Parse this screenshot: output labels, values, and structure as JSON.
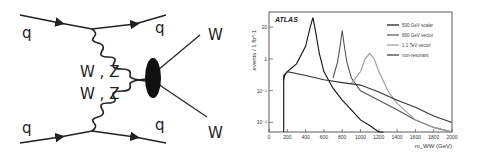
{
  "diagram": {
    "labels": {
      "q_top_left": "q",
      "q_top_right": "q",
      "q_bottom_left": "q",
      "q_bottom_right": "q",
      "boson_upper": "W , Z",
      "boson_lower": "W , Z",
      "w_out_upper": "W",
      "w_out_lower": "W"
    }
  },
  "chart_data": {
    "type": "line",
    "title": "",
    "annotation": "ATLAS",
    "xlabel": "m_WW (GeV)",
    "ylabel": "events / 1 fb^-1",
    "xlim": [
      0,
      2000
    ],
    "ylim": [
      0.005,
      30
    ],
    "yscale": "log",
    "xticks": [
      "0",
      "200",
      "400",
      "600",
      "800",
      "1000",
      "1200",
      "1400",
      "1600",
      "1800",
      "2000"
    ],
    "yticks": [
      "10^-2",
      "10^-1",
      "1",
      "10"
    ],
    "grid": false,
    "legend_position": "upper right",
    "series": [
      {
        "name": "500 GeV scalar",
        "color": "#111111",
        "x": [
          160,
          170,
          200,
          300,
          400,
          450,
          480,
          500,
          550,
          600,
          700,
          800,
          900,
          1000,
          1100,
          1200,
          1250
        ],
        "values": [
          0.2,
          0.3,
          0.4,
          0.7,
          2.5,
          10,
          20,
          10,
          1.5,
          0.4,
          0.12,
          0.05,
          0.025,
          0.012,
          0.008,
          0.005,
          0.005
        ]
      },
      {
        "name": "800 GeV vector",
        "color": "#555555",
        "x": [
          700,
          750,
          780,
          800,
          820,
          850,
          900,
          1000,
          1200,
          1400,
          1600,
          1800,
          2000
        ],
        "values": [
          0.25,
          0.8,
          3,
          8,
          3,
          0.8,
          0.25,
          0.1,
          0.05,
          0.025,
          0.012,
          0.007,
          0.005
        ]
      },
      {
        "name": "1.1 TeV vector",
        "color": "#999999",
        "x": [
          900,
          1000,
          1050,
          1100,
          1150,
          1200,
          1300,
          1400,
          1600,
          1800,
          2000
        ],
        "values": [
          0.17,
          0.4,
          1.0,
          1.5,
          1.0,
          0.4,
          0.1,
          0.04,
          0.012,
          0.007,
          0.005
        ]
      },
      {
        "name": "non-resonant",
        "color": "#333333",
        "x": [
          160,
          200,
          400,
          600,
          800,
          1000,
          1200,
          1400,
          1600,
          1800,
          2000
        ],
        "values": [
          0.3,
          0.4,
          0.3,
          0.22,
          0.18,
          0.15,
          0.09,
          0.05,
          0.03,
          0.016,
          0.01
        ]
      }
    ]
  }
}
